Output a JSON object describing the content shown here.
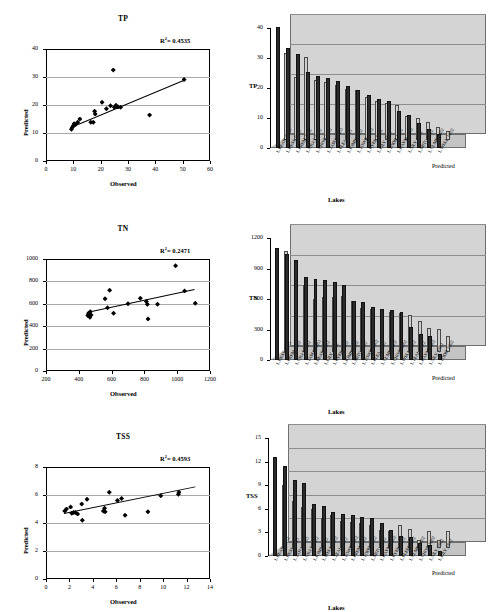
{
  "figure": {
    "scatter_axis": {
      "x": "Observed",
      "y": "Predicted"
    },
    "bar_axis": {
      "x": "Lakes",
      "depth_series": "Predicted"
    },
    "legend": {
      "predicted": "Predicted",
      "observed": "Observed"
    }
  },
  "chart_data": [
    {
      "type": "scatter",
      "title": "TP",
      "annotation": "R2 = 0.4535",
      "r2": 0.4535,
      "xlabel": "Observed",
      "ylabel": "Predicted",
      "xlim": [
        0,
        60
      ],
      "ylim": [
        0,
        40
      ],
      "xticks": [
        0,
        10,
        20,
        30,
        40,
        50,
        60
      ],
      "yticks": [
        0,
        10,
        20,
        30,
        40
      ],
      "grid": true,
      "points": [
        {
          "x": 9.3,
          "y": 11.3
        },
        {
          "x": 9.6,
          "y": 12.0
        },
        {
          "x": 10.0,
          "y": 12.6
        },
        {
          "x": 10.3,
          "y": 13.3
        },
        {
          "x": 10.8,
          "y": 13.0
        },
        {
          "x": 11.6,
          "y": 13.8
        },
        {
          "x": 12.4,
          "y": 15.0
        },
        {
          "x": 16.4,
          "y": 13.8
        },
        {
          "x": 17.3,
          "y": 13.8
        },
        {
          "x": 17.8,
          "y": 17.8
        },
        {
          "x": 18.0,
          "y": 16.8
        },
        {
          "x": 20.5,
          "y": 21.0
        },
        {
          "x": 22.1,
          "y": 18.7
        },
        {
          "x": 23.6,
          "y": 19.7
        },
        {
          "x": 24.6,
          "y": 32.5
        },
        {
          "x": 25.0,
          "y": 19.2
        },
        {
          "x": 25.6,
          "y": 19.9
        },
        {
          "x": 26.4,
          "y": 19.3
        },
        {
          "x": 27.3,
          "y": 19.2
        },
        {
          "x": 37.9,
          "y": 16.4
        },
        {
          "x": 50.5,
          "y": 29.1
        }
      ],
      "trendline": {
        "x0": 9.0,
        "y0": 12.2,
        "x1": 50.8,
        "y1": 29.2
      }
    },
    {
      "type": "bar",
      "title": "TP",
      "xlabel": "Lakes",
      "ylabel": "TP",
      "ylim": [
        0,
        40
      ],
      "yticks": [
        0,
        10,
        20,
        30,
        40
      ],
      "grid": true,
      "categories": [
        "L.BEAR_0503",
        "L.HESS_0403",
        "L.PREM_0502",
        "L.GRAS_0602",
        "L.CHOO_0603",
        "L.TAMA_0403",
        "L.PLEA_0503",
        "L.KIMB_0502",
        "L.TOWN_0502",
        "L.RYER_0602",
        "L.LILY_0602",
        "L.TODD_0502",
        "L.HAYM_0602",
        "L.SILV_0602",
        "L.MITC_0602",
        "L.CLME_0602",
        "L.WELL_0602"
      ],
      "series": [
        {
          "name": "Predicted",
          "values": [
            29.0,
            21.0,
            27.8,
            20.0,
            19.6,
            18.5,
            17.2,
            16.8,
            14.5,
            13.0,
            12.6,
            11.8,
            8.2,
            7.6,
            6.0,
            4.4,
            3.2
          ]
        },
        {
          "name": "Observed",
          "values": [
            40.5,
            33.2,
            31.2,
            25.2,
            24.0,
            23.2,
            22.2,
            20.8,
            19.4,
            17.8,
            16.4,
            15.6,
            12.2,
            11.0,
            8.4,
            6.2,
            4.6
          ]
        }
      ]
    },
    {
      "type": "scatter",
      "title": "TN",
      "annotation": "R2 = 0.2471",
      "r2": 0.2471,
      "xlabel": "Observed",
      "ylabel": "Predicted",
      "xlim": [
        200,
        1200
      ],
      "ylim": [
        0,
        1000
      ],
      "xticks": [
        200,
        400,
        600,
        800,
        1000,
        1200
      ],
      "yticks": [
        0,
        200,
        400,
        600,
        800,
        1000
      ],
      "grid": true,
      "points": [
        {
          "x": 455,
          "y": 495
        },
        {
          "x": 460,
          "y": 515
        },
        {
          "x": 462,
          "y": 505
        },
        {
          "x": 468,
          "y": 480
        },
        {
          "x": 470,
          "y": 530
        },
        {
          "x": 475,
          "y": 500
        },
        {
          "x": 560,
          "y": 645
        },
        {
          "x": 575,
          "y": 565
        },
        {
          "x": 588,
          "y": 720
        },
        {
          "x": 612,
          "y": 515
        },
        {
          "x": 700,
          "y": 600
        },
        {
          "x": 775,
          "y": 650
        },
        {
          "x": 812,
          "y": 620
        },
        {
          "x": 818,
          "y": 595
        },
        {
          "x": 822,
          "y": 465
        },
        {
          "x": 880,
          "y": 595
        },
        {
          "x": 990,
          "y": 940
        },
        {
          "x": 1045,
          "y": 715
        },
        {
          "x": 1110,
          "y": 605
        }
      ],
      "trendline": {
        "x0": 452,
        "y0": 523,
        "x1": 1110,
        "y1": 728
      }
    },
    {
      "type": "bar",
      "title": "TN",
      "xlabel": "Lakes",
      "ylabel": "TN",
      "ylim": [
        0,
        1200
      ],
      "yticks": [
        0,
        300,
        600,
        900,
        1200
      ],
      "grid": true,
      "categories": [
        "L.HESS_0403",
        "L.PREM_0502",
        "L.GRAS_0602",
        "L.TAMA_0403",
        "L.BEAR_0502",
        "L.LILY_0602",
        "L.RYER_0602",
        "L.KIMB_0602",
        "L.MITC_0602",
        "L.TOWN_0502",
        "L.PLEA_0502",
        "L.CLME_0602",
        "L.CHOO_0602",
        "L.WELL_0602",
        "L.TEAL_0602",
        "L.HAYM_0602",
        "L.SILV_0602",
        "L.TODD_0502"
      ],
      "series": [
        {
          "name": "Predicted",
          "values": [
            1000,
            720,
            660,
            520,
            540,
            545,
            550,
            500,
            440,
            430,
            420,
            400,
            390,
            370,
            310,
            240,
            225,
            160
          ]
        },
        {
          "name": "Observed",
          "values": [
            1105,
            1045,
            985,
            815,
            800,
            790,
            770,
            735,
            585,
            570,
            520,
            505,
            495,
            470,
            320,
            255,
            235,
            60
          ]
        }
      ]
    },
    {
      "type": "scatter",
      "title": "TSS",
      "annotation": "R2 = 0.4593",
      "r2": 0.4593,
      "xlabel": "Observed",
      "ylabel": "Predicted",
      "xlim": [
        0,
        14
      ],
      "ylim": [
        0,
        8
      ],
      "xticks": [
        0,
        2,
        4,
        6,
        8,
        10,
        12,
        14
      ],
      "yticks": [
        0,
        2,
        4,
        6,
        8
      ],
      "grid": true,
      "points": [
        {
          "x": 1.6,
          "y": 4.85
        },
        {
          "x": 1.75,
          "y": 5.0
        },
        {
          "x": 2.1,
          "y": 5.15
        },
        {
          "x": 2.2,
          "y": 4.7
        },
        {
          "x": 2.35,
          "y": 4.75
        },
        {
          "x": 2.5,
          "y": 4.75
        },
        {
          "x": 2.7,
          "y": 4.65
        },
        {
          "x": 3.05,
          "y": 5.35
        },
        {
          "x": 3.1,
          "y": 4.2
        },
        {
          "x": 3.5,
          "y": 5.7
        },
        {
          "x": 4.9,
          "y": 4.85
        },
        {
          "x": 5.0,
          "y": 5.05
        },
        {
          "x": 5.05,
          "y": 4.8
        },
        {
          "x": 5.4,
          "y": 6.2
        },
        {
          "x": 6.1,
          "y": 5.6
        },
        {
          "x": 6.45,
          "y": 5.75
        },
        {
          "x": 6.75,
          "y": 4.55
        },
        {
          "x": 8.7,
          "y": 4.8
        },
        {
          "x": 9.8,
          "y": 5.95
        },
        {
          "x": 11.3,
          "y": 6.05
        },
        {
          "x": 11.35,
          "y": 6.2
        }
      ],
      "trendline": {
        "x0": 1.5,
        "y0": 4.75,
        "x1": 12.7,
        "y1": 6.65
      }
    },
    {
      "type": "bar",
      "title": "TSS",
      "xlabel": "Lakes",
      "ylabel": "TSS",
      "ylim": [
        0,
        15
      ],
      "yticks": [
        0,
        3,
        6,
        9,
        12,
        15
      ],
      "grid": true,
      "categories": [
        "L.BEAR_0502",
        "L.HESS_0403",
        "L.TAHA_0403",
        "L.GRAS_0602",
        "L.KIMP_0502",
        "L.WELL_0602",
        "L.TEAL_0602",
        "L.TOWN_0502",
        "L.PREM_0502",
        "L.TODD_0502",
        "L.MITC_0602",
        "L.HAYM_0602",
        "L.RYER_0602",
        "L.PLEM_0502",
        "L.CLME_0602",
        "L.CHOO_0602",
        "L.SILV_0602",
        "L.LILY_0602"
      ],
      "series": [
        {
          "name": "Predicted",
          "values": [
            8.1,
            6.0,
            5.2,
            5.0,
            3.8,
            4.2,
            3.5,
            3.4,
            3.2,
            3.0,
            2.3,
            2.2,
            3.0,
            2.4,
            1.1,
            2.2,
            1.0,
            2.2
          ]
        },
        {
          "name": "Observed",
          "values": [
            12.6,
            11.5,
            9.7,
            9.3,
            6.6,
            6.4,
            5.6,
            5.4,
            5.2,
            5.0,
            4.8,
            4.2,
            3.3,
            2.6,
            2.4,
            1.6,
            1.4,
            0.6
          ]
        }
      ]
    }
  ]
}
